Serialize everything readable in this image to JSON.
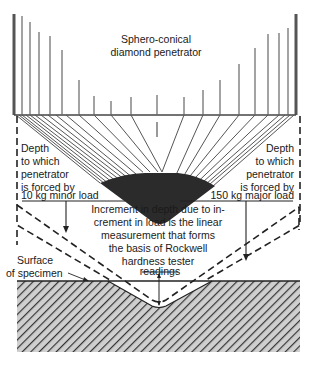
{
  "diagram": {
    "title_lines": [
      "Sphero-conical",
      "diamond penetrator"
    ],
    "left_label_lines": [
      "Depth",
      "to which",
      "penetrator",
      "is forced by",
      "10 kg minor load"
    ],
    "right_label_lines": [
      "Depth",
      "to which",
      "penetrator",
      "is forced by",
      "150 kg major load"
    ],
    "center_label_lines": [
      "Increment in depth due to in-",
      "crement in load is the linear",
      "measurement that forms",
      "the basis of Rockwell",
      "hardness tester",
      "readings"
    ],
    "surface_label_lines": [
      "Surface",
      "of specimen"
    ],
    "minor_load_kg": 10,
    "major_load_kg": 150,
    "colors": {
      "line": "#2a2a2a",
      "penetrator_lines": "#555555",
      "tip_fill": "#2b2b2b",
      "hatch": "#3a3a3a",
      "hatch_bg": "#c8c8c8"
    }
  }
}
